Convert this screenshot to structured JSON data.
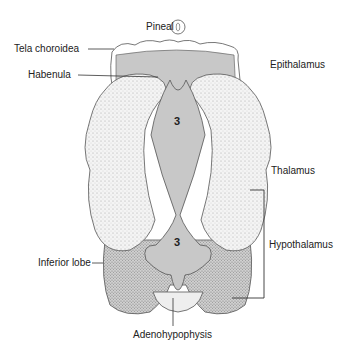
{
  "labels": {
    "pineal": "Pineal",
    "tela_choroidea": "Tela choroidea",
    "habenula": "Habenula",
    "epithalamus": "Epithalamus",
    "thalamus": "Thalamus",
    "hypothalamus": "Hypothalamus",
    "inferior_lobe": "Inferior lobe",
    "adenohypophysis": "Adenohypophysis"
  },
  "ventricle_labels": {
    "upper": "3",
    "lower": "3"
  },
  "colors": {
    "ventricle_gray": "#c8c8c8",
    "thalamus_fill": "#eeeeee",
    "hypothalamus_fill": "#b8b8b8",
    "outline": "#444444"
  }
}
